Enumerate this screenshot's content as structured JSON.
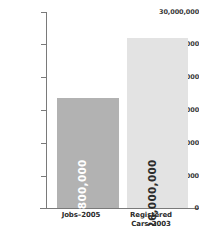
{
  "chart_data": {
    "type": "bar",
    "title": "",
    "xlabel": "",
    "ylabel": "",
    "categories": [
      "Jobs–2005",
      "Registered Cars–2003"
    ],
    "category_lines": [
      [
        "Jobs–2005"
      ],
      [
        "Registered",
        "Cars–2003"
      ]
    ],
    "values": [
      16800000,
      26000000
    ],
    "value_labels": [
      "16,800,000",
      "26,000,000"
    ],
    "ylim": [
      0,
      30000000
    ],
    "ytick_values": [
      0,
      5000000,
      10000000,
      15000000,
      20000000,
      25000000,
      30000000
    ],
    "ytick_labels": [
      "0",
      "5,000,000",
      "10,000,000",
      "15,000,000",
      "20,000,000",
      "25,000,000",
      "30,000,000"
    ],
    "grid": false,
    "legend": false,
    "bar_colors": [
      "#b2b2b2",
      "#e3e3e3"
    ],
    "value_label_colors": [
      "#ffffff",
      "#2b2b2b"
    ],
    "axis_color": "#7a7a7a",
    "background": "#ffffff"
  }
}
